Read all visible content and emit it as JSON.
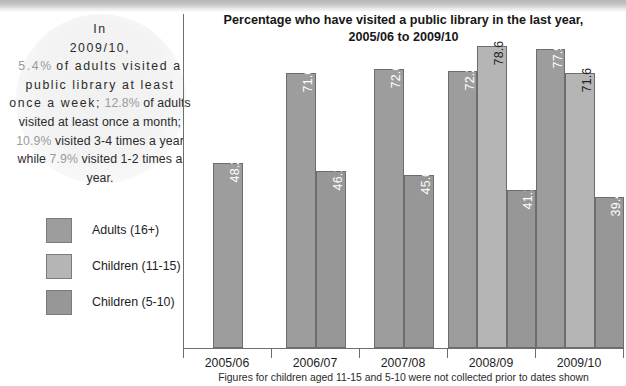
{
  "callout": {
    "line1": "In",
    "line2": "2009/10,",
    "p1": "5.4%",
    "t1": "of adults visited a public library at least once a week;",
    "p2": "12.8%",
    "t2": "of adults visited at least once a month;",
    "p3": "10.9%",
    "t3": "visited 3-4 times a year while",
    "p4": "7.9%",
    "t4": "visited 1-2 times a year.",
    "highlight_color": "#9b9b9b"
  },
  "legend": {
    "items": [
      {
        "label": "Adults (16+)",
        "color": "#9d9d9d",
        "key": "adults"
      },
      {
        "label": "Children (11-15)",
        "color": "#b5b5b5",
        "key": "children-11-15"
      },
      {
        "label": "Children (5-10)",
        "color": "#979797",
        "key": "children-5-10"
      }
    ]
  },
  "chart_data": {
    "type": "bar",
    "title": "Percentage who have visited a public library in the last year, 2005/06 to 2009/10",
    "title_line1": "Percentage who have visited a public library in the last year,",
    "title_line2": "2005/06 to 2009/10",
    "xlabel": "",
    "ylabel": "",
    "ylim": [
      0,
      87
    ],
    "grid": false,
    "legend_position": "left",
    "categories": [
      "2005/06",
      "2006/07",
      "2007/08",
      "2008/09",
      "2009/10"
    ],
    "series": [
      {
        "name": "Adults (16+)",
        "color": "#9d9d9d",
        "values": [
          48.2,
          71.6,
          72.6,
          72.2,
          77.9
        ]
      },
      {
        "name": "Children (11-15)",
        "color": "#b5b5b5",
        "values": [
          null,
          null,
          null,
          78.6,
          71.6
        ]
      },
      {
        "name": "Children (5-10)",
        "color": "#979797",
        "values": [
          null,
          46.1,
          45.0,
          41.1,
          39.4
        ]
      }
    ],
    "footnote": "Figures for children aged 11-15 and 5-10 were not collected prior to dates shown"
  }
}
